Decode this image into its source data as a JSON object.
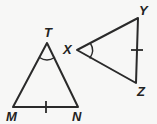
{
  "figure": {
    "background_color": "#f7f7f6",
    "stroke_color": "#2a2a2a",
    "label_color": "#232323",
    "width": 157,
    "height": 124,
    "triangles": [
      {
        "name": "triangle-TMN",
        "vertices": [
          {
            "label": "T",
            "x": 47,
            "y": 43,
            "label_x": 44,
            "label_y": 37
          },
          {
            "label": "M",
            "x": 13,
            "y": 107,
            "label_x": 6,
            "label_y": 121
          },
          {
            "label": "N",
            "x": 78,
            "y": 107,
            "label_x": 72,
            "label_y": 121
          }
        ],
        "path": "M 47 43 L 13 107 L 78 107 Z",
        "angle_mark": {
          "at": "T",
          "type": "single-arc",
          "path": "M 39.5 57.5 Q 47 62.5 54.5 57.5"
        },
        "tick_marks": [
          {
            "on_side": "MN",
            "count": 1,
            "path": "M 46 101 L 46 113"
          }
        ]
      },
      {
        "name": "triangle-XYZ",
        "vertices": [
          {
            "label": "X",
            "x": 77,
            "y": 50,
            "label_x": 63,
            "label_y": 54
          },
          {
            "label": "Y",
            "x": 138,
            "y": 18,
            "label_x": 139,
            "label_y": 15
          },
          {
            "label": "Z",
            "x": 136,
            "y": 83,
            "label_x": 137,
            "label_y": 96
          }
        ],
        "path": "M 77 50 L 138 18 L 136 83 Z",
        "angle_mark": {
          "at": "X",
          "type": "single-arc",
          "path": "M 90.5 43.5 Q 95 50.5 90 58"
        },
        "tick_marks": [
          {
            "on_side": "YZ",
            "count": 1,
            "path": "M 131 50 L 143 50"
          }
        ]
      }
    ]
  }
}
